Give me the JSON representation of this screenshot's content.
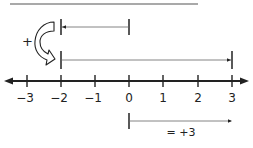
{
  "diagram": {
    "type": "number-line-addition",
    "number_line": {
      "min": -3,
      "max": 3,
      "ticks": [
        "−3",
        "−2",
        "−1",
        "0",
        "1",
        "2",
        "3"
      ]
    },
    "operation_symbol": "+",
    "segments": [
      {
        "name": "first-addend",
        "from": 0,
        "to": -2,
        "direction": "left"
      },
      {
        "name": "second-addend",
        "from": -2,
        "to": 3,
        "direction": "right"
      },
      {
        "name": "sum",
        "from": 0,
        "to": 3,
        "direction": "right"
      }
    ],
    "result_label": "= +3",
    "colors": {
      "ink": "#222222",
      "thin_line": "#555555",
      "background": "#ffffff"
    }
  }
}
